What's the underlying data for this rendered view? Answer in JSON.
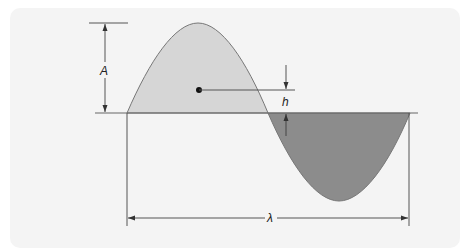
{
  "diagram": {
    "labels": {
      "amplitude": "A",
      "height": "h",
      "wavelength": "λ"
    },
    "colors": {
      "background": "#f4f4f4",
      "crest_fill": "#d6d6d6",
      "trough_fill": "#8c8c8c",
      "line": "#555555",
      "point": "#111111"
    }
  }
}
